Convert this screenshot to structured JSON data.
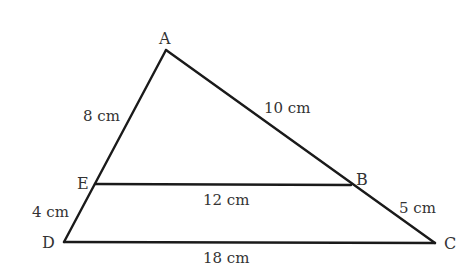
{
  "diagram": {
    "type": "triangle-with-parallel-segment",
    "vertices": {
      "A": {
        "label": "A",
        "x": 166,
        "y": 50
      },
      "B": {
        "label": "B",
        "x": 351,
        "y": 185
      },
      "C": {
        "label": "C",
        "x": 435,
        "y": 243
      },
      "D": {
        "label": "D",
        "x": 64,
        "y": 242
      },
      "E": {
        "label": "E",
        "x": 95,
        "y": 184
      }
    },
    "lengths": {
      "AE": "8 cm",
      "ED": "4 cm",
      "AB": "10 cm",
      "BC": "5 cm",
      "EB": "12 cm",
      "DC": "18 cm"
    }
  }
}
